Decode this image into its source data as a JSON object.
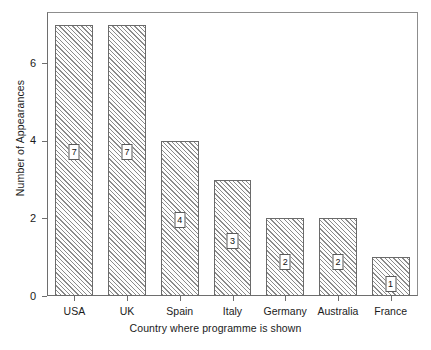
{
  "chart_data": {
    "type": "bar",
    "title": "",
    "subtitle": "",
    "xlabel": "Country where programme is shown",
    "ylabel": "Number of Appearances",
    "categories": [
      "USA",
      "UK",
      "Spain",
      "Italy",
      "Germany",
      "Australia",
      "France"
    ],
    "values": [
      7,
      7,
      4,
      3,
      2,
      2,
      1
    ],
    "data_labels": [
      "7",
      "7",
      "4",
      "3",
      "2",
      "2",
      "1"
    ],
    "ylim": [
      0,
      7.3
    ],
    "y_ticks": [
      0,
      2,
      4,
      6
    ],
    "y_tick_labels": [
      "0",
      "2",
      "4",
      "6"
    ],
    "grid": false,
    "legend": null,
    "legend_position": "none",
    "bar_fill": "hatched-diagonal",
    "bar_edge_color": "#6a6a6a",
    "hatch_color": "#8a8a8a",
    "axis_color": "#6e6e6e",
    "frame_color": "#8d8d8d",
    "background": "#ffffff",
    "text_color": "#1a1a1a"
  }
}
